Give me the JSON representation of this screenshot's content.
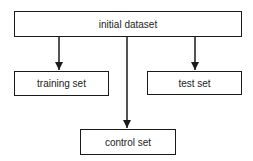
{
  "diagram": {
    "type": "flowchart",
    "nodes": [
      {
        "id": "initial",
        "label": "initial dataset"
      },
      {
        "id": "training",
        "label": "training set"
      },
      {
        "id": "test",
        "label": "test set"
      },
      {
        "id": "control",
        "label": "control set"
      }
    ],
    "edges": [
      {
        "from": "initial",
        "to": "training"
      },
      {
        "from": "initial",
        "to": "test"
      },
      {
        "from": "initial",
        "to": "control"
      }
    ],
    "colors": {
      "stroke": "#1a1a1a",
      "background": "#ffffff",
      "text": "#222222"
    }
  }
}
